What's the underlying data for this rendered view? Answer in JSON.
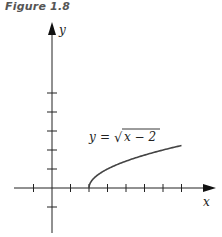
{
  "figure": {
    "title": "Figure 1.8"
  },
  "chart_data": {
    "type": "line",
    "title": "Figure 1.8",
    "xlabel": "x",
    "ylabel": "y",
    "annotation": "y = √(x − 2)",
    "equation": {
      "lhs": "y",
      "eq": "=",
      "sqrt": "√",
      "radicand": "x − 2"
    },
    "xlim": [
      -2,
      7.5
    ],
    "ylim": [
      -2,
      8
    ],
    "x_ticks": [
      -1,
      1,
      2,
      3,
      4,
      5,
      6,
      7
    ],
    "y_ticks": [
      -1,
      1,
      2,
      3,
      4,
      5
    ],
    "tick_labels_shown": false,
    "grid": false,
    "series": [
      {
        "name": "y = sqrt(x - 2)",
        "x": [
          2,
          2.25,
          2.5,
          3,
          3.5,
          4,
          4.5,
          5,
          5.5,
          6,
          6.5,
          7
        ],
        "y": [
          0,
          0.5,
          0.707,
          1,
          1.225,
          1.414,
          1.581,
          1.732,
          1.871,
          2,
          2.121,
          2.236
        ]
      }
    ],
    "colors": {
      "axis": "#222222",
      "curve": "#444444"
    }
  }
}
